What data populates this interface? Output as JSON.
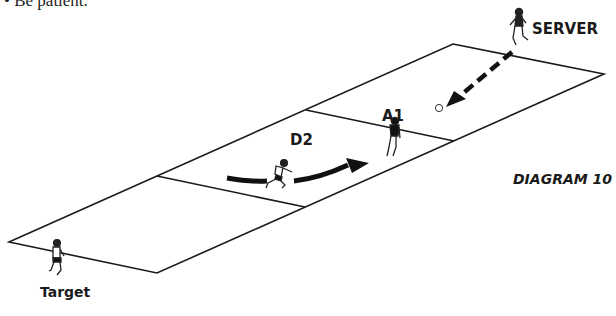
{
  "bullet_text": "• Be patient.",
  "labels": {
    "server": "SERVER",
    "attacker": "A1",
    "defender": "D2",
    "target": "Target",
    "diagram_title": "DIAGRAM 10"
  },
  "field": {
    "zones": 3,
    "line_color": "#1a1a1a",
    "description": "Three-zone rectangular playing grid drawn in perspective"
  },
  "players": [
    {
      "id": "server",
      "label": "SERVER",
      "role": "server"
    },
    {
      "id": "a1",
      "label": "A1",
      "role": "attacker"
    },
    {
      "id": "d2",
      "label": "D2",
      "role": "defender"
    },
    {
      "id": "target",
      "label": "Target",
      "role": "target player"
    }
  ],
  "movements": [
    {
      "type": "pass",
      "style": "dashed-arrow",
      "from": "server",
      "to": "ball"
    },
    {
      "type": "run",
      "style": "solid-curved-arrow",
      "from": "d2",
      "toward": "a1"
    }
  ]
}
